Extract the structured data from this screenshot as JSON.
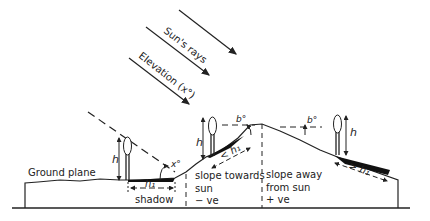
{
  "diagram": {
    "type": "terrain-shadow-cross-section",
    "rays": {
      "label_1": "Sun's rays",
      "label_2": "Elevation (x°)",
      "count": 3
    },
    "labels": {
      "ground_plane": "Ground plane",
      "shadow": "shadow",
      "slope_towards_1": "slope towards",
      "slope_towards_2": "sun",
      "slope_towards_3": "− ve",
      "slope_away_1": "slope away",
      "slope_away_2": "from sun",
      "slope_away_3": "+ ve"
    },
    "symbols": {
      "height": "h",
      "shadow_flat": "h₁",
      "shadow_towards": "< h₁",
      "shadow_away": "> h₁",
      "elevation_angle": "x°",
      "slope_angle_left": "b°",
      "slope_angle_right": "b°"
    },
    "colors": {
      "ink": "#222222",
      "shadow_fill": "#111111",
      "background": "#ffffff"
    }
  }
}
